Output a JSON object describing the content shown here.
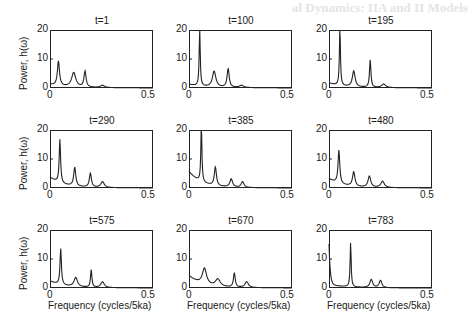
{
  "chart_data": {
    "type": "line",
    "layout": {
      "rows": 3,
      "cols": 3,
      "grid": false,
      "legend": "none"
    },
    "shared": {
      "xlabel": "Frequency (cycles/5ka)",
      "ylabel": "Power, h(ω)",
      "xlim": [
        0,
        0.5
      ],
      "ylim": [
        0,
        20
      ],
      "xticks": [
        "0",
        "0.5"
      ],
      "yticks": [
        "0",
        "10",
        "20"
      ]
    },
    "panels": [
      {
        "title": "t=1",
        "baseline": 1.0,
        "peaks": [
          [
            0.041,
            8.5,
            0.006
          ],
          [
            0.115,
            5.0,
            0.012
          ],
          [
            0.17,
            5.5,
            0.006
          ],
          [
            0.255,
            0.8,
            0.012
          ]
        ]
      },
      {
        "title": "t=100",
        "baseline": 1.0,
        "peaks": [
          [
            0.052,
            20.0,
            0.003
          ],
          [
            0.122,
            5.5,
            0.01
          ],
          [
            0.19,
            6.5,
            0.006
          ],
          [
            0.255,
            0.8,
            0.012
          ]
        ]
      },
      {
        "title": "t=195",
        "baseline": 1.5,
        "peaks": [
          [
            0.053,
            20.0,
            0.003
          ],
          [
            0.12,
            5.5,
            0.008
          ],
          [
            0.2,
            9.5,
            0.004
          ],
          [
            0.265,
            1.2,
            0.012
          ]
        ]
      },
      {
        "title": "t=290",
        "baseline": 3.5,
        "peaks": [
          [
            0.048,
            15.0,
            0.004
          ],
          [
            0.12,
            6.5,
            0.006
          ],
          [
            0.196,
            4.8,
            0.006
          ],
          [
            0.255,
            2.0,
            0.01
          ]
        ]
      },
      {
        "title": "t=385",
        "baseline": 5.5,
        "peaks": [
          [
            0.06,
            20.0,
            0.003
          ],
          [
            0.128,
            6.5,
            0.006
          ],
          [
            0.205,
            2.8,
            0.008
          ],
          [
            0.26,
            2.0,
            0.008
          ]
        ]
      },
      {
        "title": "t=480",
        "baseline": 3.0,
        "peaks": [
          [
            0.048,
            11.5,
            0.005
          ],
          [
            0.12,
            5.0,
            0.007
          ],
          [
            0.196,
            3.8,
            0.008
          ],
          [
            0.26,
            2.2,
            0.01
          ]
        ]
      },
      {
        "title": "t=575",
        "baseline": 2.2,
        "peaks": [
          [
            0.052,
            12.5,
            0.004
          ],
          [
            0.125,
            3.2,
            0.01
          ],
          [
            0.2,
            6.0,
            0.004
          ],
          [
            0.255,
            2.0,
            0.01
          ]
        ]
      },
      {
        "title": "t=670",
        "baseline": 4.0,
        "peaks": [
          [
            0.075,
            5.5,
            0.012
          ],
          [
            0.14,
            2.5,
            0.014
          ],
          [
            0.22,
            5.0,
            0.005
          ],
          [
            0.28,
            2.0,
            0.01
          ]
        ]
      },
      {
        "title": "t=783",
        "baseline": 14.0,
        "peaks": [
          [
            0.105,
            15.5,
            0.003
          ],
          [
            0.205,
            2.8,
            0.008
          ],
          [
            0.25,
            2.5,
            0.008
          ]
        ]
      }
    ]
  },
  "background_bleed": {
    "heading": "al Dynamics: IIA and II Models"
  }
}
